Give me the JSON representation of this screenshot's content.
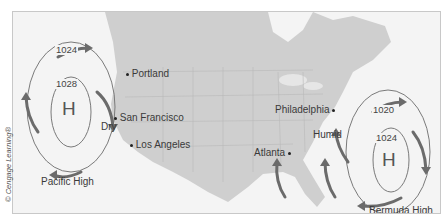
{
  "credit": "© Cengage Learning®",
  "pressure_systems": [
    {
      "name": "Pacific High",
      "symbol": "H",
      "isobars": [
        "1024",
        "1028"
      ]
    },
    {
      "name": "Bermuda High",
      "symbol": "H",
      "isobars": [
        "1020",
        "1024"
      ]
    }
  ],
  "cities": [
    {
      "name": "Portland"
    },
    {
      "name": "San Francisco"
    },
    {
      "name": "Los Angeles"
    },
    {
      "name": "Philadelphia"
    },
    {
      "name": "Atlanta"
    }
  ],
  "climate_labels": {
    "west": "Dry",
    "east": "Humid"
  },
  "colors": {
    "land": "#cfcfcf",
    "water": "#f4f4f4",
    "arrow": "#6b6b6b",
    "isobar": "#7a7a7a",
    "border": "#b8b8b8"
  }
}
